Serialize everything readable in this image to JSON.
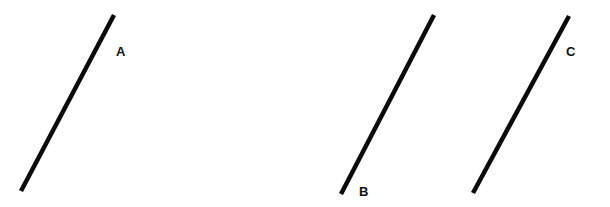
{
  "diagram": {
    "background": "#ffffff",
    "stroke_color": "#0a0a0a",
    "stroke_width": 4.5,
    "lines": [
      {
        "id": "A",
        "label": "A",
        "x1": 114,
        "y1": 15,
        "x2": 21,
        "y2": 191,
        "label_x": 116,
        "label_y": 45
      },
      {
        "id": "B",
        "label": "B",
        "x1": 434,
        "y1": 15,
        "x2": 341,
        "y2": 194,
        "label_x": 359,
        "label_y": 185
      },
      {
        "id": "C",
        "label": "C",
        "x1": 569,
        "y1": 16,
        "x2": 473,
        "y2": 193,
        "label_x": 566,
        "label_y": 45
      }
    ]
  }
}
